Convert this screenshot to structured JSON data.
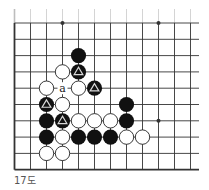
{
  "diagram": {
    "caption": "17도",
    "grid": {
      "columns": 12,
      "rows": 10,
      "edges": [
        "left",
        "bottom"
      ]
    },
    "colors": {
      "line": "#333333",
      "black_stone": "#111111",
      "white_stone_fill": "#ffffff",
      "white_stone_stroke": "#222222",
      "triangle_mark": "#d9d9d9"
    },
    "star_points": [
      {
        "col": 3,
        "row": 0
      },
      {
        "col": 9,
        "row": 0
      },
      {
        "col": 9,
        "row": 6
      }
    ],
    "stones": [
      {
        "color": "black",
        "col": 4,
        "row": 2
      },
      {
        "color": "white",
        "col": 3,
        "row": 3
      },
      {
        "color": "black",
        "col": 4,
        "row": 3,
        "mark": "triangle"
      },
      {
        "color": "white",
        "col": 2,
        "row": 4
      },
      {
        "color": "white",
        "col": 4,
        "row": 4
      },
      {
        "color": "black",
        "col": 5,
        "row": 4,
        "mark": "triangle"
      },
      {
        "color": "black",
        "col": 2,
        "row": 5,
        "mark": "triangle"
      },
      {
        "color": "white",
        "col": 3,
        "row": 5
      },
      {
        "color": "black",
        "col": 7,
        "row": 5
      },
      {
        "color": "black",
        "col": 2,
        "row": 6
      },
      {
        "color": "black",
        "col": 3,
        "row": 6,
        "mark": "triangle"
      },
      {
        "color": "white",
        "col": 4,
        "row": 6
      },
      {
        "color": "white",
        "col": 5,
        "row": 6
      },
      {
        "color": "white",
        "col": 6,
        "row": 6
      },
      {
        "color": "black",
        "col": 7,
        "row": 6
      },
      {
        "color": "black",
        "col": 2,
        "row": 7
      },
      {
        "color": "white",
        "col": 3,
        "row": 7
      },
      {
        "color": "black",
        "col": 4,
        "row": 7
      },
      {
        "color": "black",
        "col": 5,
        "row": 7
      },
      {
        "color": "black",
        "col": 6,
        "row": 7
      },
      {
        "color": "white",
        "col": 7,
        "row": 7
      },
      {
        "color": "white",
        "col": 8,
        "row": 7
      },
      {
        "color": "white",
        "col": 2,
        "row": 8
      },
      {
        "color": "white",
        "col": 3,
        "row": 8
      }
    ],
    "labels": [
      {
        "text": "a",
        "col": 3,
        "row": 4
      }
    ]
  }
}
